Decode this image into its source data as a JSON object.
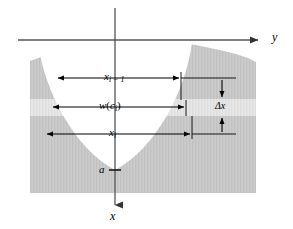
{
  "figure": {
    "background_color": "#ffffff",
    "width": 293,
    "height": 229
  },
  "axes": {
    "y_axis": {
      "label": "y",
      "direction": "right",
      "arrowhead": "triangle-right",
      "icon": "arrow-right-icon",
      "line_color": "#555555",
      "x_start": 18,
      "x_end": 262,
      "y_position": 40
    },
    "x_axis": {
      "label": "x",
      "direction": "down",
      "arrowhead": "triangle-down",
      "icon": "arrow-down-icon",
      "line_color": "#555555",
      "y_start": 8,
      "y_end": 209,
      "x_position": 115
    },
    "origin": {
      "x": 115,
      "y": 40
    }
  },
  "region": {
    "name": "shaded-solid-region",
    "fill_color": "#c8c8c8",
    "notch_fill_color": "#ffffff",
    "description": "gray solid with upward-opening white parabolic notch"
  },
  "strip": {
    "name": "riemann-strip",
    "fill_color": "#e4e4e4",
    "top_y": 99,
    "bottom_y": 116
  },
  "dimensions": [
    {
      "id": "x-i-minus-1",
      "label_main": "x",
      "label_sub": "i − 1",
      "orientation": "horizontal",
      "y": 78,
      "x_left": 56,
      "x_right": 181,
      "arrowheads": "both"
    },
    {
      "id": "w-c-i",
      "label_main": "w",
      "label_paren_open": "(",
      "label_inner": "c",
      "label_sub": "i",
      "label_paren_close": ")",
      "orientation": "horizontal",
      "y": 107,
      "x_left": 51,
      "x_right": 186,
      "arrowheads": "both"
    },
    {
      "id": "x-i",
      "label_main": "x",
      "label_sub": "i",
      "orientation": "horizontal",
      "y": 134,
      "x_left": 45,
      "x_right": 192,
      "arrowheads": "both"
    },
    {
      "id": "delta-x",
      "label_main": "Δx",
      "orientation": "vertical",
      "x": 222,
      "y_top": 84,
      "y_bottom": 128,
      "arrowheads": "both"
    }
  ],
  "markers": {
    "vertex": {
      "label": "a",
      "x": 104,
      "y": 170,
      "tick_color": "#000000"
    }
  },
  "colors": {
    "solid_gray": "#c8c8c8",
    "strip_gray": "#e4e4e4",
    "notch_white": "#ffffff",
    "axis_gray": "#555555",
    "ink_black": "#000000",
    "page_white": "#ffffff"
  }
}
